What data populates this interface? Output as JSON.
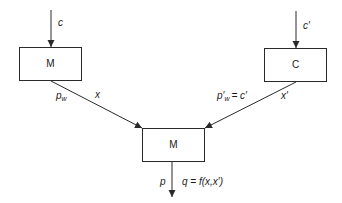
{
  "diagram": {
    "type": "flow",
    "nodes": [
      {
        "id": "left",
        "label": "M"
      },
      {
        "id": "right",
        "label": "C"
      },
      {
        "id": "bottom",
        "label": "M"
      }
    ],
    "edges": {
      "input_left": {
        "label": "c"
      },
      "input_right": {
        "label": "c′"
      },
      "left_to_bottom": {
        "price_label": "p",
        "price_sub": "w",
        "qty_label": "x"
      },
      "right_to_bottom": {
        "price_label": "p′",
        "price_sub": "w",
        "price_eq": "= c′",
        "qty_label": "x′"
      },
      "output": {
        "price_label": "p",
        "qty_label": "q = f(x,x′)"
      }
    }
  }
}
